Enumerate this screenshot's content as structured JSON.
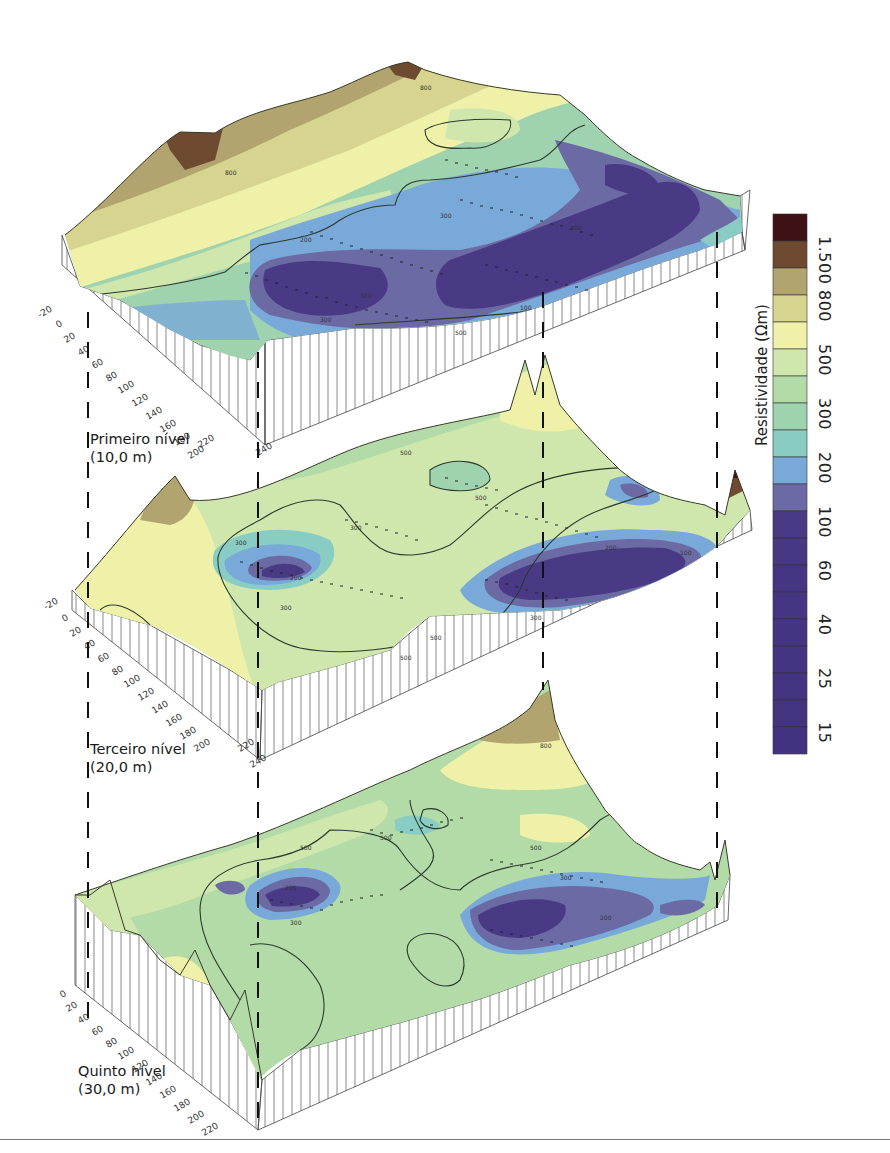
{
  "figure": {
    "type": "3D stacked resistivity block diagrams",
    "levels": [
      {
        "id": "level-1",
        "name": "Primeiro nível",
        "depth": "(10,0 m)"
      },
      {
        "id": "level-3",
        "name": "Terceiro nível",
        "depth": "(20,0 m)"
      },
      {
        "id": "level-5",
        "name": "Quinto nível",
        "depth": "(30,0 m)"
      }
    ],
    "axis_ticks_front": [
      "-20",
      "0",
      "20",
      "40",
      "60",
      "80",
      "100",
      "120",
      "140",
      "160",
      "180",
      "200",
      "220",
      "240"
    ],
    "contour_labels": [
      "1500",
      "800",
      "500",
      "300",
      "200",
      "100"
    ]
  },
  "legend": {
    "title": "Resistividade (Ωm)",
    "tick_labels": [
      "1.500",
      "800",
      "500",
      "300",
      "200",
      "100",
      "60",
      "40",
      "25",
      "15"
    ],
    "swatches": [
      "#3e1214",
      "#6e4a31",
      "#b1a46e",
      "#d6d48e",
      "#eef1a7",
      "#cfe6ad",
      "#b2dba8",
      "#9fd2ae",
      "#88ccc3",
      "#79a9d9",
      "#6c6aa5",
      "#4a3a86",
      "#483783",
      "#463582",
      "#463582",
      "#453481",
      "#453481",
      "#443380",
      "#44337f",
      "#43327f"
    ]
  }
}
